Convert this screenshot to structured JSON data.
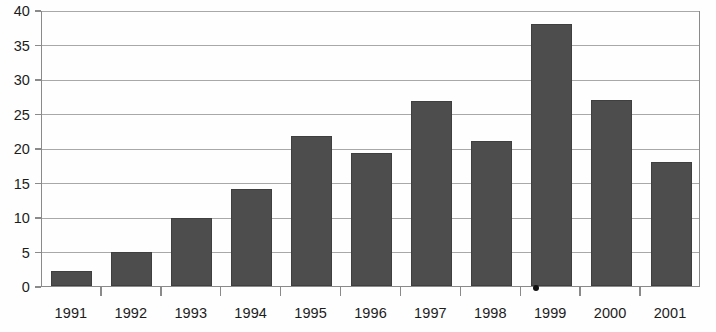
{
  "chart_data": {
    "type": "bar",
    "title": "",
    "subtitle": "",
    "xlabel": "",
    "ylabel": "",
    "categories": [
      "1991",
      "1992",
      "1993",
      "1994",
      "1995",
      "1996",
      "1997",
      "1998",
      "1999",
      "2000",
      "2001"
    ],
    "values": [
      2.2,
      5.0,
      9.8,
      14.0,
      21.7,
      19.3,
      26.8,
      21.0,
      38.0,
      27.0,
      18.0
    ],
    "series": [
      {
        "name": "",
        "values": [
          2.2,
          5.0,
          9.8,
          14.0,
          21.7,
          19.3,
          26.8,
          21.0,
          38.0,
          27.0,
          18.0
        ]
      }
    ],
    "ylim": [
      0,
      40
    ],
    "ytick_values": [
      0,
      5,
      10,
      15,
      20,
      25,
      30,
      35,
      40
    ],
    "ytick_labels": [
      "0",
      "5",
      "10",
      "15",
      "20",
      "25",
      "30",
      "35",
      "40"
    ],
    "grid": true,
    "grid_axis": "y",
    "legend": false,
    "legend_position": "none",
    "annotations": [],
    "colors": {
      "bar_fill": "#4d4d4d",
      "bar_edge": "#3f3f3f",
      "gridline": "#a8a8a8",
      "axis_line": "#8a8a8a",
      "tick_label": "#1c1c1c",
      "background": "#fefefe"
    }
  },
  "artifacts": {
    "scan_speck": {
      "name": "scan-speck",
      "x": 533,
      "y": 285,
      "color": "#111111"
    }
  }
}
